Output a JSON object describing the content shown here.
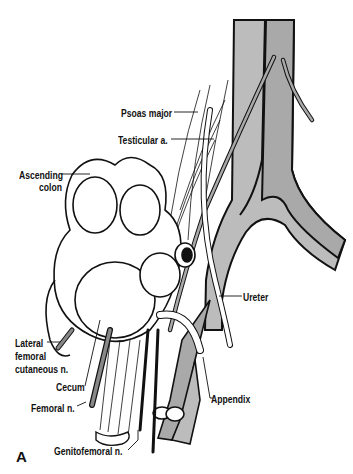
{
  "figure": {
    "panel_letter": "A",
    "colors": {
      "vessel_fill": "#a9a9a9",
      "vessel_fill_light": "#bcbcbc",
      "outline": "#111111",
      "background": "#ffffff"
    },
    "labels": {
      "psoas_major": "Psoas major",
      "testicular_a": "Testicular a.",
      "ascending_colon_1": "Ascending",
      "ascending_colon_2": "colon",
      "ureter": "Ureter",
      "lateral_femoral_1": "Lateral",
      "lateral_femoral_2": "femoral",
      "lateral_femoral_3": "cutaneous n.",
      "cecum": "Cecum",
      "femoral_n": "Femoral n.",
      "appendix": "Appendix",
      "genitofemoral_n": "Genitofemoral n."
    }
  }
}
